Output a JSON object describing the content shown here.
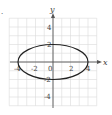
{
  "problem_marker": ".",
  "chart_data": {
    "type": "line",
    "title": "",
    "xlabel": "x",
    "ylabel": "y",
    "xlim": [
      -5,
      5
    ],
    "ylim": [
      -5,
      5
    ],
    "grid": true,
    "x_ticks": [
      "-4",
      "-2",
      "0",
      "2",
      "4"
    ],
    "y_ticks": [
      "4",
      "2",
      "-2",
      "-4"
    ],
    "series": [
      {
        "name": "ellipse",
        "shape": "ellipse",
        "center": [
          0,
          0
        ],
        "semi_major_x": 4,
        "semi_minor_y": 2,
        "vertices": [
          [
            -4,
            0
          ],
          [
            4,
            0
          ],
          [
            0,
            2
          ],
          [
            0,
            -2
          ]
        ]
      }
    ]
  },
  "colors": {
    "grid": "#d9d9d9",
    "axis": "#555555",
    "curve": "#222222"
  }
}
